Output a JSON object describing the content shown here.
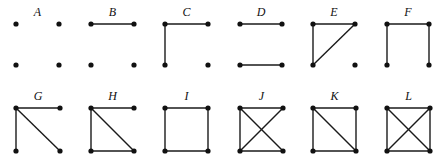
{
  "figure": {
    "rows": [
      {
        "y_top": 24,
        "y_bottom": 65,
        "label_y": 16,
        "graphs": [
          {
            "label": "A",
            "x_left": 16,
            "x_right": 59,
            "edges": []
          },
          {
            "label": "B",
            "x_left": 91,
            "x_right": 134,
            "edges": [
              [
                "tl",
                "tr"
              ]
            ]
          },
          {
            "label": "C",
            "x_left": 165,
            "x_right": 208,
            "edges": [
              [
                "tl",
                "tr"
              ],
              [
                "tl",
                "bl"
              ]
            ]
          },
          {
            "label": "D",
            "x_left": 240,
            "x_right": 282,
            "edges": [
              [
                "tl",
                "tr"
              ],
              [
                "bl",
                "br"
              ]
            ]
          },
          {
            "label": "E",
            "x_left": 313,
            "x_right": 355,
            "edges": [
              [
                "tl",
                "tr"
              ],
              [
                "tl",
                "bl"
              ],
              [
                "tr",
                "bl"
              ]
            ]
          },
          {
            "label": "F",
            "x_left": 387,
            "x_right": 429,
            "edges": [
              [
                "tl",
                "tr"
              ],
              [
                "tl",
                "bl"
              ],
              [
                "tr",
                "br"
              ]
            ]
          }
        ]
      },
      {
        "y_top": 108,
        "y_bottom": 151,
        "label_y": 100,
        "graphs": [
          {
            "label": "G",
            "x_left": 16,
            "x_right": 60,
            "edges": [
              [
                "tl",
                "tr"
              ],
              [
                "tl",
                "bl"
              ],
              [
                "tl",
                "br"
              ]
            ]
          },
          {
            "label": "H",
            "x_left": 91,
            "x_right": 134,
            "edges": [
              [
                "tl",
                "tr"
              ],
              [
                "tl",
                "bl"
              ],
              [
                "tl",
                "br"
              ],
              [
                "bl",
                "br"
              ]
            ]
          },
          {
            "label": "I",
            "x_left": 165,
            "x_right": 208,
            "edges": [
              [
                "tl",
                "tr"
              ],
              [
                "tl",
                "bl"
              ],
              [
                "tr",
                "br"
              ],
              [
                "bl",
                "br"
              ]
            ]
          },
          {
            "label": "J",
            "x_left": 240,
            "x_right": 283,
            "edges": [
              [
                "tl",
                "tr"
              ],
              [
                "tl",
                "bl"
              ],
              [
                "tl",
                "br"
              ],
              [
                "tr",
                "bl"
              ],
              [
                "bl",
                "br"
              ]
            ]
          },
          {
            "label": "K",
            "x_left": 313,
            "x_right": 356,
            "edges": [
              [
                "tl",
                "tr"
              ],
              [
                "tl",
                "bl"
              ],
              [
                "tr",
                "br"
              ],
              [
                "bl",
                "br"
              ],
              [
                "tl",
                "br"
              ]
            ]
          },
          {
            "label": "L",
            "x_left": 387,
            "x_right": 430,
            "edges": [
              [
                "tl",
                "tr"
              ],
              [
                "tl",
                "bl"
              ],
              [
                "tr",
                "br"
              ],
              [
                "bl",
                "br"
              ],
              [
                "tl",
                "br"
              ],
              [
                "tr",
                "bl"
              ]
            ]
          }
        ]
      }
    ],
    "vertex_radius": 2.6,
    "colors": {
      "ink": "#111111",
      "background": "#ffffff"
    }
  }
}
